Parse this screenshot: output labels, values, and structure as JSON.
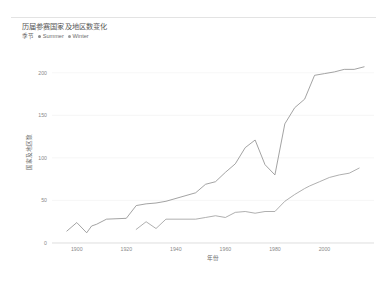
{
  "chart_data": {
    "type": "line",
    "title": "历届参赛国家及地区数变化",
    "xlabel": "年份",
    "ylabel": "国家及地区数",
    "xlim": [
      1890,
      2020
    ],
    "ylim": [
      0,
      215
    ],
    "grid": true,
    "legend_position": "top-left",
    "legend_title": "季节",
    "x_ticks": [
      "1900",
      "1920",
      "1940",
      "1960",
      "1980",
      "2000"
    ],
    "x_tick_values": [
      1900,
      1920,
      1940,
      1960,
      1980,
      2000
    ],
    "y_ticks": [
      "0",
      "50",
      "100",
      "150",
      "200"
    ],
    "y_tick_values": [
      0,
      50,
      100,
      150,
      200
    ],
    "series": [
      {
        "name": "Summer",
        "color": "#8c8c8c",
        "x": [
          1896,
          1900,
          1904,
          1906,
          1908,
          1912,
          1920,
          1924,
          1928,
          1932,
          1936,
          1948,
          1952,
          1956,
          1960,
          1964,
          1968,
          1972,
          1976,
          1980,
          1984,
          1988,
          1992,
          1996,
          2000,
          2004,
          2008,
          2012,
          2016
        ],
        "values": [
          14,
          24,
          12,
          20,
          22,
          28,
          29,
          44,
          46,
          47,
          49,
          59,
          69,
          72,
          83,
          93,
          112,
          121,
          92,
          80,
          140,
          159,
          169,
          197,
          199,
          201,
          204,
          204,
          207
        ]
      },
      {
        "name": "Winter",
        "color": "#9a9a9a",
        "x": [
          1924,
          1928,
          1932,
          1936,
          1948,
          1952,
          1956,
          1960,
          1964,
          1968,
          1972,
          1976,
          1980,
          1984,
          1988,
          1992,
          1994,
          1998,
          2002,
          2006,
          2010,
          2014
        ],
        "values": [
          16,
          25,
          17,
          28,
          28,
          30,
          32,
          30,
          36,
          37,
          35,
          37,
          37,
          49,
          57,
          64,
          67,
          72,
          77,
          80,
          82,
          88
        ]
      }
    ]
  },
  "legend": {
    "title": "季节",
    "items": [
      {
        "label": "Summer",
        "color": "#8c8c8c"
      },
      {
        "label": "Winter",
        "color": "#9a9a9a"
      }
    ]
  }
}
